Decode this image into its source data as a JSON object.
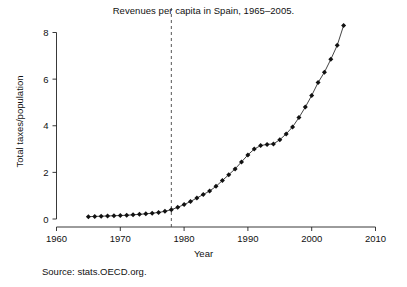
{
  "chart_data": {
    "type": "line",
    "title": "Revenues per capita in Spain, 1965–2005.",
    "xlabel": "Year",
    "ylabel": "Total taxes/population",
    "xlim": [
      1960,
      2010
    ],
    "ylim": [
      0,
      8.6
    ],
    "xticks": [
      1960,
      1970,
      1980,
      1990,
      2000,
      2010
    ],
    "xtick_labels": [
      "1960",
      "1970",
      "1980",
      "1990",
      "2000",
      "2010"
    ],
    "yticks": [
      0,
      2,
      4,
      6,
      8
    ],
    "ytick_labels": [
      "0",
      "2",
      "4",
      "6",
      "8"
    ],
    "grid": false,
    "legend": null,
    "marker": "diamond",
    "annotations": [
      {
        "name": "vertical-reference-line",
        "type": "vline",
        "x": 1978,
        "style": "dashed"
      }
    ],
    "x": [
      1965,
      1966,
      1967,
      1968,
      1969,
      1970,
      1971,
      1972,
      1973,
      1974,
      1975,
      1976,
      1977,
      1978,
      1979,
      1980,
      1981,
      1982,
      1983,
      1984,
      1985,
      1986,
      1987,
      1988,
      1989,
      1990,
      1991,
      1992,
      1993,
      1994,
      1995,
      1996,
      1997,
      1998,
      1999,
      2000,
      2001,
      2002,
      2003,
      2004,
      2005
    ],
    "values": [
      0.1,
      0.11,
      0.12,
      0.13,
      0.14,
      0.15,
      0.16,
      0.18,
      0.2,
      0.22,
      0.25,
      0.28,
      0.33,
      0.4,
      0.5,
      0.62,
      0.75,
      0.9,
      1.05,
      1.2,
      1.4,
      1.65,
      1.9,
      2.15,
      2.45,
      2.75,
      3.0,
      3.15,
      3.2,
      3.22,
      3.4,
      3.65,
      3.95,
      4.35,
      4.8,
      5.3,
      5.85,
      6.3,
      6.85,
      7.45,
      8.3
    ],
    "series": [
      {
        "name": "Total taxes/population",
        "values": [
          0.1,
          0.11,
          0.12,
          0.13,
          0.14,
          0.15,
          0.16,
          0.18,
          0.2,
          0.22,
          0.25,
          0.28,
          0.33,
          0.4,
          0.5,
          0.62,
          0.75,
          0.9,
          1.05,
          1.2,
          1.4,
          1.65,
          1.9,
          2.15,
          2.45,
          2.75,
          3.0,
          3.15,
          3.2,
          3.22,
          3.4,
          3.65,
          3.95,
          4.35,
          4.8,
          5.3,
          5.85,
          6.3,
          6.85,
          7.45,
          8.3
        ]
      }
    ]
  },
  "figure": {
    "title": "Revenues per capita in Spain, 1965–2005.",
    "x_axis_label": "Year",
    "y_axis_label": "Total taxes/population",
    "source_note": "Source: stats.OECD.org."
  },
  "colors": {
    "line": "#222222",
    "marker": "#111111",
    "axis": "#222222",
    "vline": "#444444",
    "background": "#ffffff",
    "text": "#111111"
  }
}
